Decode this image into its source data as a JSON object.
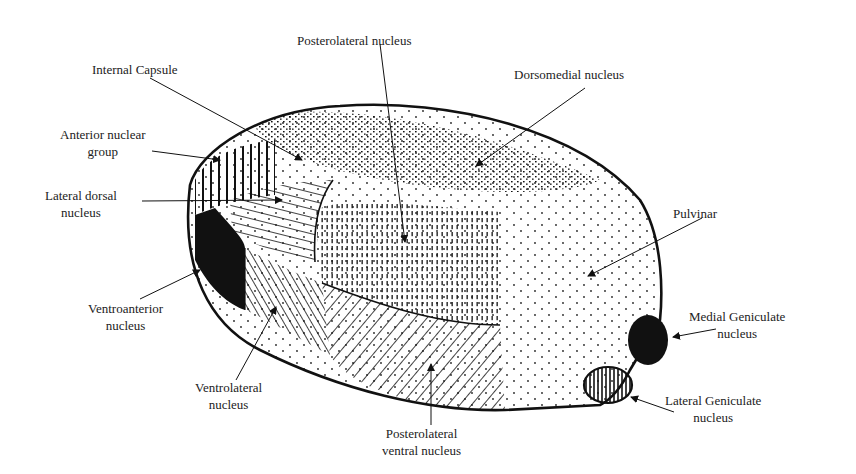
{
  "diagram": {
    "labels": {
      "posterolateral": {
        "lines": [
          "Posterolateral nucleus"
        ]
      },
      "internal_capsule": {
        "lines": [
          "Internal Capsule"
        ]
      },
      "dorsomedial": {
        "lines": [
          "Dorsomedial nucleus"
        ]
      },
      "anterior_group": {
        "lines": [
          "Anterior nuclear",
          "group"
        ]
      },
      "lateral_dorsal": {
        "lines": [
          "Lateral dorsal",
          "nucleus"
        ]
      },
      "pulvinar": {
        "lines": [
          "Pulvinar"
        ]
      },
      "ventroanterior": {
        "lines": [
          "Ventroanterior",
          "nucleus"
        ]
      },
      "medial_geniculate": {
        "lines": [
          "Medial Geniculate",
          "nucleus"
        ]
      },
      "ventrolateral": {
        "lines": [
          "Ventrolateral",
          "nucleus"
        ]
      },
      "lateral_geniculate": {
        "lines": [
          "Lateral Geniculate",
          "nucleus"
        ]
      },
      "posterolateral_ventral": {
        "lines": [
          "Posterolateral",
          "ventral nucleus"
        ]
      }
    }
  }
}
